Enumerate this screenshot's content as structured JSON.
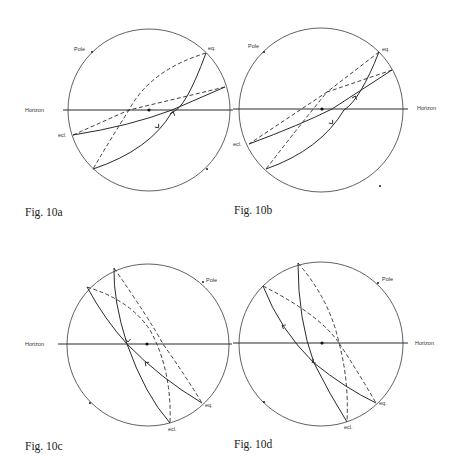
{
  "figures": [
    {
      "id": "10a",
      "caption": "Fig. 10a",
      "caption_pos": [
        25,
        206
      ],
      "circle": {
        "cx": 149,
        "cy": 110,
        "r": 81
      },
      "horizon": {
        "x1": 63,
        "x2": 233,
        "y": 110
      },
      "center_dot": [
        149,
        110
      ],
      "labels": [
        {
          "text": "Pole",
          "x": 74,
          "y": 51,
          "anchor": "start"
        },
        {
          "text": "eq.",
          "x": 208,
          "y": 50,
          "anchor": "start"
        },
        {
          "text": "ecl.",
          "x": 58,
          "y": 137,
          "anchor": "start"
        },
        {
          "text": "Horizon",
          "x": 25,
          "y": 112,
          "anchor": "start"
        }
      ],
      "ticks": [
        [
          92,
          52
        ],
        [
          207,
          169
        ]
      ],
      "solid_paths": [
        "M206,53 Q185,110 172,112 Q150,150 93,169",
        "M73,135 Q130,126 172,110 L225,87"
      ],
      "dashed_paths": [
        "M206,53 Q150,70 129,110 Q110,140 93,169",
        "M73,135 L129,110 L225,87"
      ],
      "arrows": [
        {
          "x": 158,
          "y": 127,
          "rot": -40
        },
        {
          "x": 173,
          "y": 113,
          "rot": 200
        }
      ]
    },
    {
      "id": "10b",
      "caption": "Fig. 10b",
      "caption_pos": [
        234,
        204
      ],
      "circle": {
        "cx": 321,
        "cy": 110,
        "r": 82
      },
      "horizon": {
        "x1": 233,
        "x2": 408,
        "y": 109
      },
      "center_dot": [
        322,
        109
      ],
      "labels": [
        {
          "text": "Pole",
          "x": 248,
          "y": 48,
          "anchor": "start"
        },
        {
          "text": "eq.",
          "x": 382,
          "y": 51,
          "anchor": "start"
        },
        {
          "text": "ecl.",
          "x": 233,
          "y": 146,
          "anchor": "start"
        },
        {
          "text": "Horizon",
          "x": 417,
          "y": 110,
          "anchor": "start"
        }
      ],
      "ticks": [
        [
          264,
          52
        ],
        [
          380,
          186
        ]
      ],
      "solid_paths": [
        "M379,52 Q360,100 344,110 Q320,150 266,169",
        "M249,144 Q300,125 332,109 L392,70"
      ],
      "dashed_paths": [
        "M379,52 L327,92 L249,144",
        "M392,70 L327,92 Q300,125 266,169"
      ],
      "arrows": [
        {
          "x": 332,
          "y": 123,
          "rot": -40
        },
        {
          "x": 355,
          "y": 97,
          "rot": 200
        }
      ]
    },
    {
      "id": "10c",
      "caption": "Fig. 10c",
      "caption_pos": [
        25,
        440
      ],
      "circle": {
        "cx": 148,
        "cy": 345,
        "r": 81
      },
      "horizon": {
        "x1": 58,
        "x2": 232,
        "y": 344
      },
      "center_dot": [
        147,
        344
      ],
      "labels": [
        {
          "text": "Pole",
          "x": 206,
          "y": 282,
          "anchor": "start"
        },
        {
          "text": "eq.",
          "x": 205,
          "y": 407,
          "anchor": "start"
        },
        {
          "text": "ecl.",
          "x": 168,
          "y": 431,
          "anchor": "start"
        },
        {
          "text": "Horizon",
          "x": 25,
          "y": 346,
          "anchor": "start"
        }
      ],
      "ticks": [
        [
          203,
          282
        ],
        [
          90,
          403
        ]
      ],
      "solid_paths": [
        "M114,268 Q113,300 127,344 Q145,395 170,423",
        "M87,287 Q105,320 127,344 Q160,378 202,403"
      ],
      "dashed_paths": [
        "M114,268 Q150,320 163,344 Q185,375 202,403",
        "M87,287 Q130,300 150,330 Q172,370 170,423"
      ],
      "arrows": [
        {
          "x": 146,
          "y": 363,
          "rot": 130
        },
        {
          "x": 128,
          "y": 341,
          "rot": 0
        }
      ]
    },
    {
      "id": "10d",
      "caption": "Fig. 10d",
      "caption_pos": [
        234,
        438
      ],
      "circle": {
        "cx": 321,
        "cy": 344,
        "r": 82
      },
      "horizon": {
        "x1": 233,
        "x2": 408,
        "y": 343
      },
      "center_dot": [
        322,
        343
      ],
      "labels": [
        {
          "text": "Pole",
          "x": 382,
          "y": 281,
          "anchor": "start"
        },
        {
          "text": "eq.",
          "x": 379,
          "y": 405,
          "anchor": "start"
        },
        {
          "text": "ecl.",
          "x": 344,
          "y": 429,
          "anchor": "start"
        },
        {
          "text": "Horizon",
          "x": 415,
          "y": 345,
          "anchor": "start"
        }
      ],
      "ticks": [
        [
          378,
          283
        ],
        [
          264,
          402
        ]
      ],
      "solid_paths": [
        "M298,263 Q298,320 314,363 Q330,395 347,422",
        "M263,286 Q280,330 314,363 Q345,388 376,403"
      ],
      "dashed_paths": [
        "M298,263 Q330,300 339,343 Q360,375 376,403",
        "M263,286 Q320,315 339,343 Q349,380 347,422"
      ],
      "arrows": [
        {
          "x": 283,
          "y": 326,
          "rot": 120
        },
        {
          "x": 313,
          "y": 362,
          "rot": 60
        }
      ]
    }
  ],
  "style": {
    "line_color": "#2a2a2a",
    "circle_color": "#3a3a3a",
    "background": "#ffffff"
  }
}
